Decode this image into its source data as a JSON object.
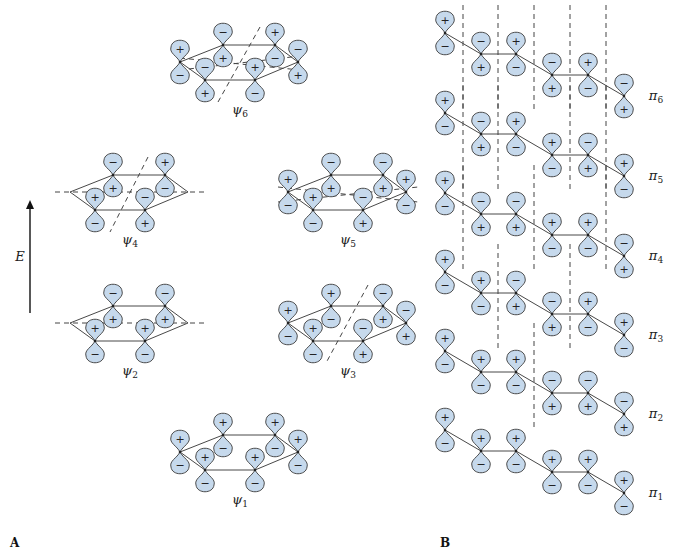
{
  "title": "Pi molecular orbitals of benzene (A) and hexatriene (B)",
  "colors": {
    "lobe_fill": "#c6d9ec",
    "lobe_stroke": "#3a3a3a",
    "line": "#333333"
  },
  "energy_axis": {
    "label": "E",
    "x": 30,
    "y_top": 200,
    "y_bottom": 313
  },
  "panel_labels": {
    "A": "A",
    "B": "B"
  },
  "panel_A": {
    "orbitals": [
      {
        "name": "ψ6",
        "symbol": "ψ",
        "sub": "6",
        "cx": 240,
        "cy": 62,
        "signs": [
          [
            "+",
            "−"
          ],
          [
            "−",
            "+"
          ],
          [
            "−",
            "+"
          ],
          [
            "+",
            "−"
          ],
          [
            "+",
            "−"
          ],
          [
            "−",
            "+"
          ]
        ],
        "nodes": [
          [
            -60,
            -4,
            60,
            8
          ],
          [
            -60,
            8,
            60,
            -6
          ],
          [
            20,
            -35,
            -22,
            40
          ]
        ]
      },
      {
        "name": "ψ4",
        "symbol": "ψ",
        "sub": "4",
        "cx": 130,
        "cy": 192,
        "signs": [
          [
            "−",
            "+"
          ],
          [
            "+",
            "−"
          ],
          [
            "−",
            "+"
          ],
          [
            "+",
            "−"
          ]
        ],
        "center_only": true,
        "nodes": [
          [
            -75,
            0,
            75,
            0
          ],
          [
            18,
            -35,
            -20,
            40
          ]
        ]
      },
      {
        "name": "ψ5",
        "symbol": "ψ",
        "sub": "5",
        "cx": 348,
        "cy": 192,
        "signs": [
          [
            "+",
            "−"
          ],
          [
            "−",
            "+"
          ],
          [
            "+",
            "−"
          ],
          [
            "−",
            "+"
          ],
          [
            "−",
            "+"
          ],
          [
            "+",
            "−"
          ]
        ],
        "nodes": [
          [
            -70,
            -5,
            70,
            10
          ],
          [
            -70,
            10,
            70,
            -5
          ]
        ]
      },
      {
        "name": "ψ2",
        "symbol": "ψ",
        "sub": "2",
        "cx": 130,
        "cy": 323,
        "signs": [
          [
            "−",
            "+"
          ],
          [
            "+",
            "−"
          ],
          [
            "+",
            "−"
          ],
          [
            "−",
            "+"
          ]
        ],
        "center_only": true,
        "nodes": [
          [
            -75,
            0,
            75,
            0
          ]
        ]
      },
      {
        "name": "ψ3",
        "symbol": "ψ",
        "sub": "3",
        "cx": 348,
        "cy": 323,
        "signs": [
          [
            "+",
            "−"
          ],
          [
            "+",
            "−"
          ],
          [
            "+",
            "−"
          ],
          [
            "−",
            "+"
          ],
          [
            "−",
            "+"
          ],
          [
            "−",
            "+"
          ]
        ],
        "nodes": [
          [
            20,
            -38,
            -22,
            40
          ]
        ]
      },
      {
        "name": "ψ1",
        "symbol": "ψ",
        "sub": "1",
        "cx": 240,
        "cy": 452,
        "signs": [
          [
            "+",
            "−"
          ],
          [
            "+",
            "−"
          ],
          [
            "+",
            "−"
          ],
          [
            "+",
            "−"
          ],
          [
            "+",
            "−"
          ],
          [
            "+",
            "−"
          ]
        ],
        "nodes": []
      }
    ]
  },
  "panel_B": {
    "atom_x": [
      445,
      481,
      516,
      552,
      588,
      624
    ],
    "atom_dy": [
      0,
      21,
      21,
      42,
      42,
      63
    ],
    "orbitals": [
      {
        "name": "π6",
        "symbol": "π",
        "sub": "6",
        "y0": 33,
        "signs": [
          [
            "+",
            "−"
          ],
          [
            "−",
            "+"
          ],
          [
            "+",
            "−"
          ],
          [
            "−",
            "+"
          ],
          [
            "+",
            "−"
          ],
          [
            "−",
            "+"
          ]
        ],
        "nodes": [
          463,
          498,
          534,
          570,
          606
        ]
      },
      {
        "name": "π5",
        "symbol": "π",
        "sub": "5",
        "y0": 113,
        "signs": [
          [
            "+",
            "−"
          ],
          [
            "−",
            "+"
          ],
          [
            "+",
            "−"
          ],
          [
            "+",
            "−"
          ],
          [
            "−",
            "+"
          ],
          [
            "+",
            "−"
          ]
        ],
        "nodes": [
          463,
          498,
          570,
          606
        ]
      },
      {
        "name": "π4",
        "symbol": "π",
        "sub": "4",
        "y0": 193,
        "signs": [
          [
            "+",
            "−"
          ],
          [
            "−",
            "+"
          ],
          [
            "−",
            "+"
          ],
          [
            "+",
            "−"
          ],
          [
            "+",
            "−"
          ],
          [
            "−",
            "+"
          ]
        ],
        "nodes": [
          463,
          534,
          606
        ]
      },
      {
        "name": "π3",
        "symbol": "π",
        "sub": "3",
        "y0": 272,
        "signs": [
          [
            "+",
            "−"
          ],
          [
            "+",
            "−"
          ],
          [
            "−",
            "+"
          ],
          [
            "−",
            "+"
          ],
          [
            "+",
            "−"
          ],
          [
            "+",
            "−"
          ]
        ],
        "nodes": [
          498,
          570
        ]
      },
      {
        "name": "π2",
        "symbol": "π",
        "sub": "2",
        "y0": 351,
        "signs": [
          [
            "+",
            "−"
          ],
          [
            "+",
            "−"
          ],
          [
            "+",
            "−"
          ],
          [
            "−",
            "+"
          ],
          [
            "−",
            "+"
          ],
          [
            "−",
            "+"
          ]
        ],
        "nodes": [
          534
        ]
      },
      {
        "name": "π1",
        "symbol": "π",
        "sub": "1",
        "y0": 430,
        "signs": [
          [
            "+",
            "−"
          ],
          [
            "+",
            "−"
          ],
          [
            "+",
            "−"
          ],
          [
            "+",
            "−"
          ],
          [
            "+",
            "−"
          ],
          [
            "+",
            "−"
          ]
        ],
        "nodes": []
      }
    ]
  }
}
